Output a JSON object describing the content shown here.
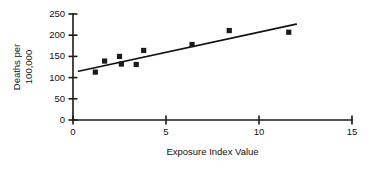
{
  "chart_data": {
    "type": "scatter",
    "title": "",
    "xlabel": "Exposure Index Value",
    "ylabel_line1": "Deaths per",
    "ylabel_line2": "100,000",
    "xlim": [
      0,
      15
    ],
    "ylim": [
      0,
      250
    ],
    "xticks": [
      0,
      5,
      10,
      15
    ],
    "yticks": [
      0,
      50,
      100,
      150,
      200,
      250
    ],
    "xtick_labels": [
      "0",
      "5",
      "10",
      "15"
    ],
    "ytick_labels": [
      "0",
      "50",
      "100",
      "150",
      "200",
      "250"
    ],
    "grid": false,
    "legend": false,
    "marker_color": "#1a1a1a",
    "line_color": "#111111",
    "points": [
      {
        "x": 1.2,
        "y": 113
      },
      {
        "x": 1.7,
        "y": 139
      },
      {
        "x": 2.5,
        "y": 150
      },
      {
        "x": 2.6,
        "y": 132
      },
      {
        "x": 3.4,
        "y": 131
      },
      {
        "x": 3.8,
        "y": 164
      },
      {
        "x": 6.4,
        "y": 178
      },
      {
        "x": 8.4,
        "y": 211
      },
      {
        "x": 11.6,
        "y": 207
      }
    ],
    "trend_line": {
      "x_start": 0.3,
      "y_start": 115,
      "x_end": 12.0,
      "y_end": 226
    }
  }
}
